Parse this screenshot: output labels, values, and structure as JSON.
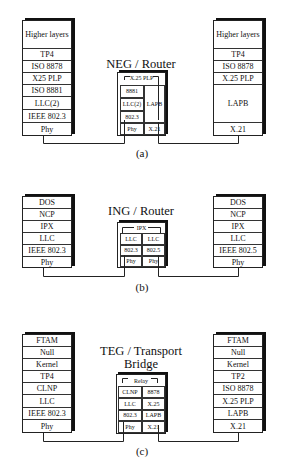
{
  "diagrams": {
    "a": {
      "caption": "(a)",
      "title": "NEG / Router",
      "left_stack": [
        "Higher layers",
        "TP4",
        "ISO 8878",
        "X25 PLP",
        "ISO 8881",
        "LLC(2)",
        "IEEE 802.3",
        "Phy"
      ],
      "right_stack": [
        "Higher layers",
        "TP4",
        "ISO 8878",
        "X.25 PLP",
        "LAPB",
        "X.21"
      ],
      "device": {
        "top": "X.25 PLP",
        "left_col": [
          "8881",
          "LLC(2)",
          "802.3",
          "Phy"
        ],
        "right_col": [
          "LAPB",
          "X.21"
        ]
      }
    },
    "b": {
      "caption": "(b)",
      "title": "ING / Router",
      "left_stack": [
        "DOS",
        "NCP",
        "IPX",
        "LLC",
        "IEEE 802.3",
        "Phy"
      ],
      "right_stack": [
        "DOS",
        "NCP",
        "IPX",
        "LLC",
        "IEEE 802.5",
        "Phy"
      ],
      "device": {
        "top": "IPX",
        "left_col": [
          "LLC",
          "802.3",
          "Phy"
        ],
        "right_col": [
          "LLC",
          "802.5",
          "Phy"
        ]
      }
    },
    "c": {
      "caption": "(c)",
      "title_line1": "TEG / Transport",
      "title_line2": "Bridge",
      "left_stack": [
        "FTAM",
        "Null",
        "Kernel",
        "TP4",
        "CLNP",
        "LLC",
        "IEEE 802.3",
        "Phy"
      ],
      "right_stack": [
        "FTAM",
        "Null",
        "Kernel",
        "TP2",
        "ISO 8878",
        "X.25 PLP",
        "LAPB",
        "X.21"
      ],
      "device": {
        "top": "Relay",
        "left_col": [
          "CLNP",
          "LLC",
          "802.3",
          "Phy"
        ],
        "right_col": [
          "8878",
          "X.25",
          "LAPB",
          "X.21"
        ]
      }
    }
  }
}
